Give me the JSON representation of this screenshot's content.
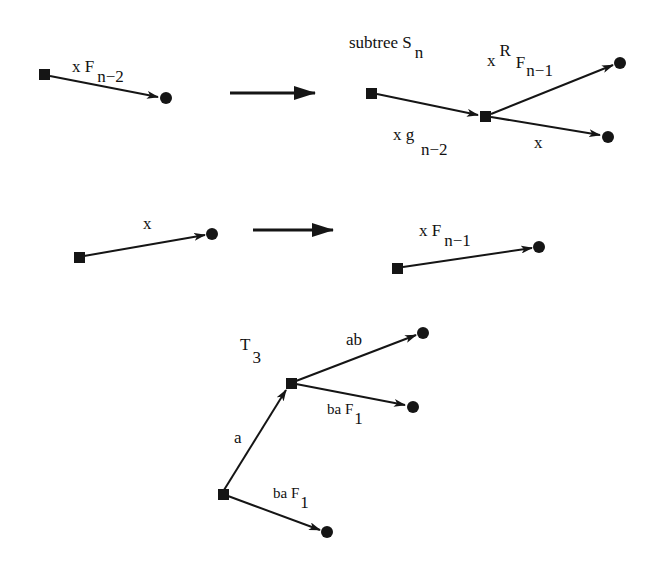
{
  "diagram": {
    "rule1": {
      "left": {
        "edge_label": "x F",
        "edge_sub": "n−2"
      },
      "right": {
        "title": "subtree S",
        "title_sub": "n",
        "edge_in": {
          "label": "x g",
          "sub": "n−2"
        },
        "edge_up": {
          "label": "x",
          "sup": "R",
          "label2": "F",
          "sub": "n−1"
        },
        "edge_down": {
          "label": "x"
        }
      }
    },
    "rule2": {
      "left": {
        "edge_label": "x"
      },
      "right": {
        "edge_label": "x F",
        "edge_sub": "n−1"
      }
    },
    "example": {
      "title": "T",
      "title_sub": "3",
      "edges": [
        {
          "label": "a"
        },
        {
          "label": "ab"
        },
        {
          "label": "ba F",
          "sub": "1"
        },
        {
          "label": "ba F",
          "sub": "1"
        }
      ]
    },
    "legend": {
      "square": "internal node",
      "circle": "leaf node"
    },
    "colors": {
      "ink": "#151515",
      "background": "#ffffff"
    }
  }
}
